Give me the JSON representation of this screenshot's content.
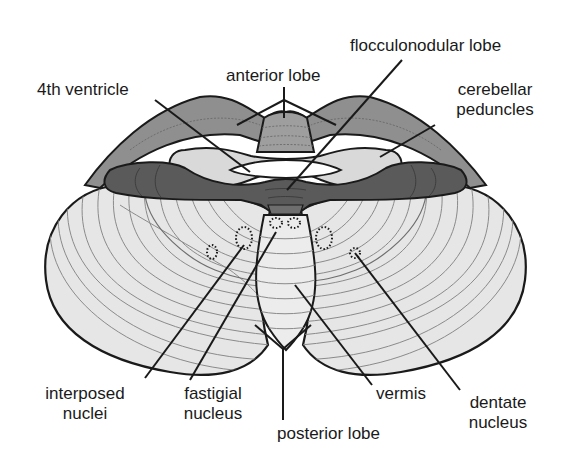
{
  "figure": {
    "colors": {
      "background": "#ffffff",
      "hemisphere_fill": "#e6e6e6",
      "folia_lines": "#8a8a8a",
      "anterior_lobe_fill": "#8c8c8c",
      "peduncle_fill": "#d8d8d8",
      "dark_band_fill": "#555555",
      "outline": "#1a1a1a"
    }
  },
  "labels": {
    "fourth_ventricle": "4th ventricle",
    "anterior_lobe": "anterior lobe",
    "flocculonodular_lobe": "flocculonodular lobe",
    "cerebellar_peduncles_line1": "cerebellar",
    "cerebellar_peduncles_line2": "peduncles",
    "interposed_nuclei_line1": "interposed",
    "interposed_nuclei_line2": "nuclei",
    "fastigial_nucleus_line1": "fastigial",
    "fastigial_nucleus_line2": "nucleus",
    "posterior_lobe": "posterior lobe",
    "vermis": "vermis",
    "dentate_nucleus_line1": "dentate",
    "dentate_nucleus_line2": "nucleus"
  }
}
